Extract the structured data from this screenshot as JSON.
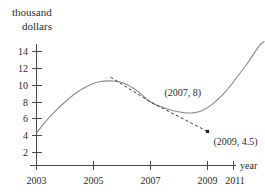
{
  "chart_data": {
    "type": "line",
    "title": "",
    "xlabel": "year",
    "ylabel": "thousand dollars",
    "ylabel_line1": "thousand",
    "ylabel_line2": "dollars",
    "xlim": [
      2003,
      2011
    ],
    "ylim": [
      0,
      15.2
    ],
    "grid": false,
    "legend": null,
    "x_ticks": [
      2003,
      2005,
      2007,
      2009,
      2011
    ],
    "x_tick_labels": [
      "2003",
      "2005",
      "2007",
      "2009",
      "2011"
    ],
    "y_ticks": [
      2,
      4,
      6,
      8,
      10,
      12,
      14
    ],
    "y_tick_labels": [
      "2",
      "4",
      "6",
      "8",
      "10",
      "12",
      "14"
    ],
    "series": [
      {
        "name": "value curve",
        "style": "solid",
        "color": "#8a8a8a",
        "x": [
          2003.0,
          2003.3,
          2003.6,
          2004.0,
          2004.4,
          2004.8,
          2005.2,
          2005.7,
          2006.1,
          2006.5,
          2007.0,
          2007.4,
          2007.8,
          2008.2,
          2008.45,
          2008.8,
          2009.2,
          2009.6,
          2010.0,
          2010.4,
          2010.8,
          2011.0
        ],
        "y": [
          4.3,
          5.6,
          6.7,
          8.0,
          9.1,
          9.9,
          10.4,
          10.5,
          10.2,
          9.4,
          8.0,
          7.4,
          6.95,
          6.72,
          6.7,
          6.95,
          7.8,
          9.1,
          10.8,
          12.6,
          14.6,
          15.2
        ]
      },
      {
        "name": "tangent line at (2007, 8)",
        "style": "dashed",
        "color": "#3a3a3a",
        "x": [
          2005.6,
          2007.0,
          2009.0
        ],
        "y": [
          10.95,
          8.0,
          4.5
        ]
      }
    ],
    "points": [
      {
        "label": "(2007, 8)",
        "x": 2007,
        "y": 8,
        "marked": false,
        "label_dx": 14,
        "label_dy": -6
      },
      {
        "label": "(2009, 4.5)",
        "x": 2009,
        "y": 4.5,
        "marked": true,
        "label_dx": 6,
        "label_dy": 14
      }
    ],
    "annotations": [
      "(2007, 8)",
      "(2009, 4.5)"
    ]
  }
}
